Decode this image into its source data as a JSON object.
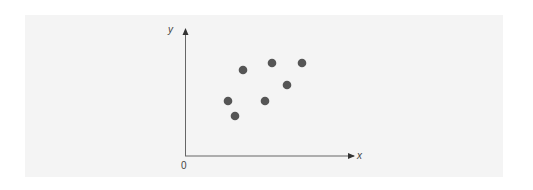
{
  "chart_data": {
    "type": "scatter",
    "title": "",
    "xlabel": "x",
    "ylabel": "y",
    "origin_label": "0",
    "grid": false,
    "legend": null,
    "axis_ticks": false,
    "points_px": [
      {
        "x": 228,
        "y": 101
      },
      {
        "x": 235,
        "y": 116
      },
      {
        "x": 243,
        "y": 70
      },
      {
        "x": 265,
        "y": 101
      },
      {
        "x": 272,
        "y": 63
      },
      {
        "x": 287,
        "y": 85
      },
      {
        "x": 302,
        "y": 63
      }
    ],
    "points_relative": [
      {
        "x": 0.25,
        "y": 0.43
      },
      {
        "x": 0.3,
        "y": 0.32
      },
      {
        "x": 0.34,
        "y": 0.68
      },
      {
        "x": 0.47,
        "y": 0.43
      },
      {
        "x": 0.52,
        "y": 0.73
      },
      {
        "x": 0.61,
        "y": 0.56
      },
      {
        "x": 0.7,
        "y": 0.73
      }
    ],
    "point_color": "#555555",
    "axis_color": "#555555"
  },
  "labels": {
    "x_axis": "x",
    "y_axis": "y",
    "origin": "0"
  }
}
